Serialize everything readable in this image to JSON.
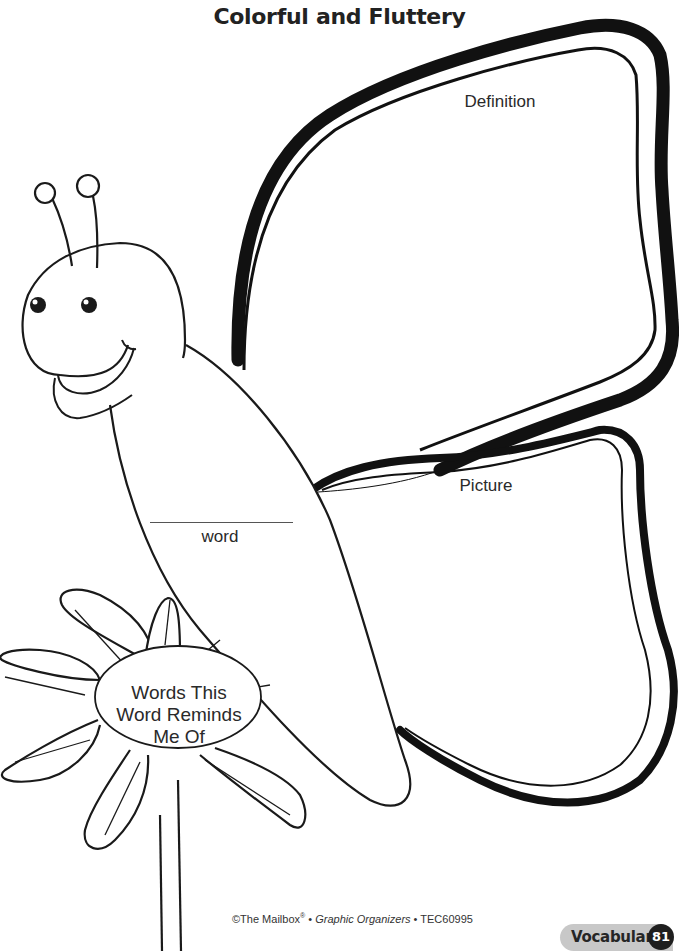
{
  "page": {
    "title": "Colorful and Fluttery",
    "section_badge": "Vocabulary",
    "page_number": "81"
  },
  "organizer": {
    "upper_wing_label": "Definition",
    "lower_wing_label": "Picture",
    "body_label": "word",
    "flower_center_label_lines": [
      "Words This",
      "Word Reminds",
      "Me Of"
    ]
  },
  "footer": {
    "copyright_prefix": "©The Mailbox",
    "registered_mark": "®",
    "separator": " • ",
    "book_title": "Graphic Organizers",
    "product_code": "TEC60995"
  },
  "colors": {
    "ink": "#1a1a1a",
    "badge_bg": "#c8c8c8",
    "page_number_bg": "#1f1f1f"
  }
}
